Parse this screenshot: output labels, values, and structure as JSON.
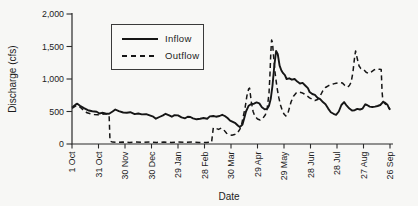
{
  "chart_data": {
    "type": "line",
    "title": "",
    "xlabel": "Date",
    "ylabel": "Discharge (cfs)",
    "grid": false,
    "ylim": [
      0,
      2000
    ],
    "ytick_values": [
      0,
      500,
      1000,
      1500,
      2000
    ],
    "ytick_labels": [
      "0",
      "500",
      "1,000",
      "1,500",
      "2,000"
    ],
    "x_unit": "days since 1 Oct",
    "xlim": [
      0,
      360
    ],
    "xtick_days": [
      0,
      30,
      60,
      90,
      120,
      150,
      180,
      210,
      240,
      270,
      300,
      330,
      360
    ],
    "xtick_labels": [
      "1 Oct",
      "31 Oct",
      "30 Nov",
      "30 Dec",
      "29 Jan",
      "28 Feb",
      "30 Mar",
      "29 Apr",
      "29 May",
      "28 Jun",
      "28 Jul",
      "27 Aug",
      "26 Sep"
    ],
    "legend": {
      "position": "upper-left-inside",
      "entries": [
        "Inflow",
        "Outflow"
      ]
    },
    "line_color": "#161616",
    "series": [
      {
        "name": "Inflow",
        "line_style": "solid",
        "color": "#161616",
        "points": [
          [
            0,
            560
          ],
          [
            4,
            605
          ],
          [
            6,
            620
          ],
          [
            9,
            590
          ],
          [
            13,
            555
          ],
          [
            18,
            520
          ],
          [
            23,
            505
          ],
          [
            28,
            495
          ],
          [
            31,
            470
          ],
          [
            34,
            480
          ],
          [
            38,
            470
          ],
          [
            42,
            465
          ],
          [
            46,
            500
          ],
          [
            49,
            530
          ],
          [
            53,
            505
          ],
          [
            58,
            485
          ],
          [
            62,
            480
          ],
          [
            66,
            490
          ],
          [
            71,
            460
          ],
          [
            75,
            470
          ],
          [
            79,
            455
          ],
          [
            84,
            460
          ],
          [
            88,
            440
          ],
          [
            92,
            420
          ],
          [
            95,
            390
          ],
          [
            99,
            415
          ],
          [
            103,
            440
          ],
          [
            106,
            465
          ],
          [
            110,
            440
          ],
          [
            113,
            420
          ],
          [
            116,
            445
          ],
          [
            120,
            440
          ],
          [
            124,
            410
          ],
          [
            128,
            395
          ],
          [
            131,
            420
          ],
          [
            134,
            415
          ],
          [
            137,
            395
          ],
          [
            141,
            380
          ],
          [
            145,
            390
          ],
          [
            149,
            400
          ],
          [
            153,
            390
          ],
          [
            156,
            425
          ],
          [
            160,
            430
          ],
          [
            163,
            420
          ],
          [
            167,
            430
          ],
          [
            170,
            450
          ],
          [
            173,
            430
          ],
          [
            176,
            400
          ],
          [
            179,
            360
          ],
          [
            182,
            340
          ],
          [
            185,
            320
          ],
          [
            188,
            280
          ],
          [
            190,
            260
          ],
          [
            193,
            300
          ],
          [
            195,
            400
          ],
          [
            197,
            500
          ],
          [
            200,
            590
          ],
          [
            203,
            615
          ],
          [
            206,
            620
          ],
          [
            209,
            640
          ],
          [
            212,
            625
          ],
          [
            215,
            565
          ],
          [
            218,
            535
          ],
          [
            221,
            540
          ],
          [
            223,
            590
          ],
          [
            225,
            700
          ],
          [
            227,
            900
          ],
          [
            229,
            1200
          ],
          [
            231,
            1430
          ],
          [
            233,
            1380
          ],
          [
            235,
            1205
          ],
          [
            237,
            1130
          ],
          [
            239,
            1090
          ],
          [
            241,
            1060
          ],
          [
            243,
            1000
          ],
          [
            246,
            1010
          ],
          [
            249,
            990
          ],
          [
            252,
            1000
          ],
          [
            255,
            960
          ],
          [
            258,
            930
          ],
          [
            261,
            940
          ],
          [
            264,
            900
          ],
          [
            267,
            860
          ],
          [
            269,
            800
          ],
          [
            272,
            770
          ],
          [
            275,
            755
          ],
          [
            278,
            710
          ],
          [
            281,
            690
          ],
          [
            284,
            645
          ],
          [
            287,
            610
          ],
          [
            290,
            545
          ],
          [
            293,
            490
          ],
          [
            296,
            465
          ],
          [
            299,
            450
          ],
          [
            302,
            500
          ],
          [
            305,
            600
          ],
          [
            308,
            645
          ],
          [
            311,
            590
          ],
          [
            314,
            545
          ],
          [
            317,
            515
          ],
          [
            320,
            520
          ],
          [
            323,
            540
          ],
          [
            326,
            530
          ],
          [
            329,
            545
          ],
          [
            332,
            610
          ],
          [
            334,
            600
          ],
          [
            337,
            575
          ],
          [
            340,
            570
          ],
          [
            343,
            575
          ],
          [
            346,
            585
          ],
          [
            349,
            600
          ],
          [
            352,
            645
          ],
          [
            354,
            640
          ],
          [
            357,
            605
          ],
          [
            359,
            550
          ],
          [
            360,
            525
          ]
        ]
      },
      {
        "name": "Outflow",
        "line_style": "dashed",
        "color": "#161616",
        "points": [
          [
            0,
            550
          ],
          [
            4,
            585
          ],
          [
            6,
            595
          ],
          [
            9,
            570
          ],
          [
            13,
            520
          ],
          [
            17,
            480
          ],
          [
            21,
            465
          ],
          [
            25,
            455
          ],
          [
            29,
            450
          ],
          [
            33,
            455
          ],
          [
            37,
            460
          ],
          [
            41,
            460
          ],
          [
            42,
            450
          ],
          [
            43,
            45
          ],
          [
            46,
            30
          ],
          [
            52,
            25
          ],
          [
            58,
            30
          ],
          [
            65,
            25
          ],
          [
            72,
            30
          ],
          [
            80,
            25
          ],
          [
            88,
            30
          ],
          [
            96,
            25
          ],
          [
            104,
            30
          ],
          [
            112,
            25
          ],
          [
            120,
            30
          ],
          [
            128,
            25
          ],
          [
            136,
            30
          ],
          [
            144,
            25
          ],
          [
            152,
            25
          ],
          [
            158,
            30
          ],
          [
            160,
            250
          ],
          [
            163,
            240
          ],
          [
            166,
            225
          ],
          [
            169,
            245
          ],
          [
            172,
            215
          ],
          [
            175,
            165
          ],
          [
            178,
            145
          ],
          [
            181,
            135
          ],
          [
            184,
            145
          ],
          [
            187,
            165
          ],
          [
            190,
            225
          ],
          [
            192,
            300
          ],
          [
            194,
            430
          ],
          [
            196,
            560
          ],
          [
            198,
            740
          ],
          [
            200,
            850
          ],
          [
            201,
            860
          ],
          [
            203,
            650
          ],
          [
            205,
            500
          ],
          [
            207,
            430
          ],
          [
            210,
            385
          ],
          [
            213,
            370
          ],
          [
            216,
            395
          ],
          [
            219,
            450
          ],
          [
            221,
            550
          ],
          [
            223,
            780
          ],
          [
            224,
            1050
          ],
          [
            225,
            1400
          ],
          [
            226,
            1600
          ],
          [
            227,
            1560
          ],
          [
            228,
            1380
          ],
          [
            230,
            1080
          ],
          [
            232,
            880
          ],
          [
            234,
            720
          ],
          [
            236,
            600
          ],
          [
            238,
            520
          ],
          [
            240,
            460
          ],
          [
            242,
            430
          ],
          [
            244,
            450
          ],
          [
            246,
            550
          ],
          [
            248,
            650
          ],
          [
            251,
            740
          ],
          [
            254,
            790
          ],
          [
            257,
            800
          ],
          [
            260,
            790
          ],
          [
            263,
            770
          ],
          [
            266,
            740
          ],
          [
            269,
            710
          ],
          [
            272,
            690
          ],
          [
            275,
            670
          ],
          [
            278,
            685
          ],
          [
            281,
            740
          ],
          [
            284,
            820
          ],
          [
            287,
            870
          ],
          [
            290,
            895
          ],
          [
            293,
            915
          ],
          [
            296,
            925
          ],
          [
            299,
            935
          ],
          [
            303,
            945
          ],
          [
            306,
            940
          ],
          [
            309,
            900
          ],
          [
            312,
            875
          ],
          [
            314,
            900
          ],
          [
            316,
            950
          ],
          [
            318,
            1100
          ],
          [
            320,
            1350
          ],
          [
            321,
            1430
          ],
          [
            323,
            1310
          ],
          [
            325,
            1200
          ],
          [
            327,
            1160
          ],
          [
            330,
            1150
          ],
          [
            333,
            1105
          ],
          [
            336,
            1085
          ],
          [
            339,
            1110
          ],
          [
            342,
            1140
          ],
          [
            345,
            1155
          ],
          [
            348,
            1150
          ],
          [
            350,
            1145
          ],
          [
            351,
            800
          ],
          [
            352,
            660
          ],
          [
            354,
            625
          ],
          [
            356,
            600
          ],
          [
            358,
            570
          ],
          [
            360,
            540
          ]
        ]
      }
    ]
  }
}
